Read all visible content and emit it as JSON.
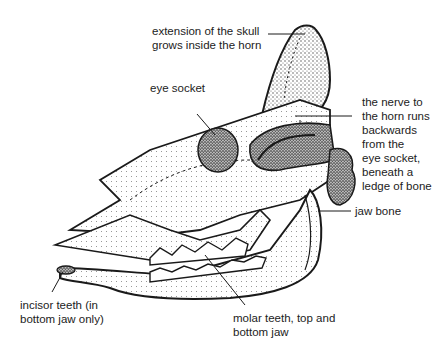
{
  "diagram": {
    "labels": {
      "horn_core": {
        "lines": [
          "extension of the skull",
          "grows inside the horn"
        ]
      },
      "eye_socket": {
        "lines": [
          "eye socket"
        ]
      },
      "nerve": {
        "lines": [
          "the nerve to",
          "the horn runs",
          "backwards",
          "from the",
          "eye socket,",
          "beneath a",
          "ledge of bone"
        ]
      },
      "jaw_bone": {
        "lines": [
          "jaw bone"
        ]
      },
      "incisors": {
        "lines": [
          "incisor teeth (in",
          "bottom jaw only)"
        ]
      },
      "molars": {
        "lines": [
          "molar teeth, top and",
          "bottom jaw"
        ]
      }
    },
    "colors": {
      "ink": "#1a1a1a",
      "stipple": "#555555",
      "background": "#ffffff"
    }
  }
}
